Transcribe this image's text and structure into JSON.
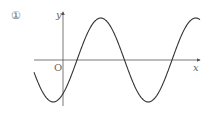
{
  "figure": {
    "marker": "①",
    "y_axis_label": "y",
    "x_axis_label": "x",
    "origin_label": "O"
  },
  "colors": {
    "curve": "#333333",
    "axes": "#555555",
    "labels": "#666666"
  },
  "chart_data": {
    "type": "line",
    "title": "①",
    "xlabel": "x",
    "ylabel": "y",
    "pixel_geometry": {
      "origin_px": [
        63,
        60
      ],
      "amplitude_px": 42,
      "period_px": 95,
      "upward_zero_crossing_px": 77,
      "x_range_px": [
        34,
        200
      ]
    },
    "grid": false,
    "legend": null
  }
}
